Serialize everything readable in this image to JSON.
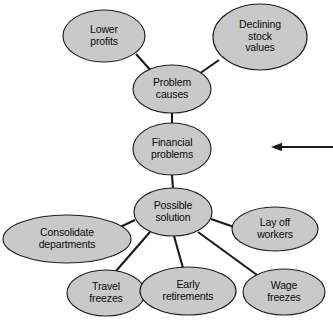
{
  "diagram": {
    "background_color": "#ffffff",
    "node_fill_color": "#c9c9c9",
    "node_stroke_color": "#1f1f1f",
    "edge_color": "#1a1a1a",
    "text_color": "#0b0b0b",
    "nodes": [
      {
        "id": "lower-profits",
        "lines": [
          "Lower",
          "profits"
        ],
        "cx": 104,
        "cy": 36,
        "rx": 41,
        "ry": 26
      },
      {
        "id": "declining-stock-values",
        "lines": [
          "Declining",
          "stock",
          "values"
        ],
        "cx": 260,
        "cy": 37,
        "rx": 47,
        "ry": 33
      },
      {
        "id": "problem-causes",
        "lines": [
          "Problem",
          "causes"
        ],
        "cx": 172,
        "cy": 89,
        "rx": 39,
        "ry": 24
      },
      {
        "id": "financial-problems",
        "lines": [
          "Financial",
          "problems"
        ],
        "cx": 172,
        "cy": 149,
        "rx": 39,
        "ry": 26
      },
      {
        "id": "possible-solution",
        "lines": [
          "Possible",
          "solution"
        ],
        "cx": 173,
        "cy": 212,
        "rx": 39,
        "ry": 24
      },
      {
        "id": "consolidate-departments",
        "lines": [
          "Consolidate",
          "departments"
        ],
        "cx": 67,
        "cy": 239,
        "rx": 64,
        "ry": 24
      },
      {
        "id": "lay-off-workers",
        "lines": [
          "Lay off",
          "workers"
        ],
        "cx": 275,
        "cy": 229,
        "rx": 43,
        "ry": 22
      },
      {
        "id": "travel-freezes",
        "lines": [
          "Travel",
          "freezes"
        ],
        "cx": 106,
        "cy": 293,
        "rx": 39,
        "ry": 23
      },
      {
        "id": "early-retirements",
        "lines": [
          "Early",
          "retirements"
        ],
        "cx": 188,
        "cy": 291,
        "rx": 48,
        "ry": 24
      },
      {
        "id": "wage-freezes",
        "lines": [
          "Wage",
          "freezes"
        ],
        "cx": 284,
        "cy": 292,
        "rx": 41,
        "ry": 23
      }
    ],
    "edges": [
      {
        "id": "edge-lower-profits",
        "from": "lower-profits",
        "to": "problem-causes",
        "x1": 136,
        "y1": 54,
        "x2": 153,
        "y2": 73
      },
      {
        "id": "edge-declining-stock",
        "from": "declining-stock-values",
        "to": "problem-causes",
        "x1": 219,
        "y1": 60,
        "x2": 199,
        "y2": 74
      },
      {
        "id": "edge-problem-financial",
        "from": "problem-causes",
        "to": "financial-problems",
        "x1": 172,
        "y1": 113,
        "x2": 172,
        "y2": 124
      },
      {
        "id": "edge-financial-solution",
        "from": "financial-problems",
        "to": "possible-solution",
        "x1": 172,
        "y1": 175,
        "x2": 173,
        "y2": 189
      },
      {
        "id": "edge-solution-consolidate",
        "from": "possible-solution",
        "to": "consolidate-departments",
        "x1": 135,
        "y1": 220,
        "x2": 118,
        "y2": 228
      },
      {
        "id": "edge-solution-layoff",
        "from": "possible-solution",
        "to": "lay-off-workers",
        "x1": 211,
        "y1": 219,
        "x2": 234,
        "y2": 227
      },
      {
        "id": "edge-solution-travel",
        "from": "possible-solution",
        "to": "travel-freezes",
        "x1": 150,
        "y1": 232,
        "x2": 116,
        "y2": 271
      },
      {
        "id": "edge-solution-early",
        "from": "possible-solution",
        "to": "early-retirements",
        "x1": 174,
        "y1": 236,
        "x2": 183,
        "y2": 268
      },
      {
        "id": "edge-solution-wage",
        "from": "possible-solution",
        "to": "wage-freezes",
        "x1": 198,
        "y1": 232,
        "x2": 257,
        "y2": 275
      }
    ],
    "annotation_arrow": {
      "id": "callout-arrow",
      "direction": "left",
      "x_start": 333,
      "x_end": 271,
      "y": 147,
      "head_length": 11,
      "head_half_width": 4.2
    }
  }
}
